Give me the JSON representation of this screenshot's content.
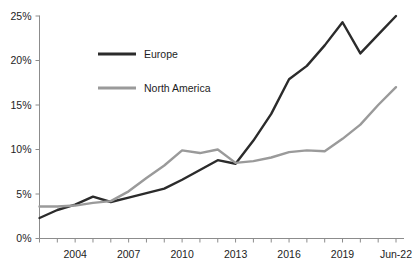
{
  "chart_data": {
    "type": "line",
    "title": "",
    "subtitle": "",
    "xlabel": "",
    "ylabel": "",
    "ylim": [
      0,
      25
    ],
    "ytick_labels": [
      "0%",
      "5%",
      "10%",
      "15%",
      "20%",
      "25%"
    ],
    "ytick_values": [
      0,
      5,
      10,
      15,
      20,
      25
    ],
    "grid": false,
    "legend_position": "inside-upper-left",
    "x": [
      2002,
      2003,
      2004,
      2005,
      2006,
      2007,
      2008,
      2009,
      2010,
      2011,
      2012,
      2013,
      2014,
      2015,
      2016,
      2017,
      2018,
      2019,
      2020,
      2021,
      2022
    ],
    "xtick_labels_shown": [
      "2004",
      "2007",
      "2010",
      "2013",
      "2016",
      "2019",
      "Jun-22"
    ],
    "xtick_label_positions": [
      2004,
      2007,
      2010,
      2013,
      2016,
      2019,
      2022
    ],
    "series": [
      {
        "name": "Europe",
        "color": "#2b2b2b",
        "values": [
          2.3,
          3.2,
          3.8,
          4.7,
          4.1,
          4.6,
          5.1,
          5.6,
          6.6,
          7.7,
          8.8,
          8.4,
          11.0,
          14.0,
          17.9,
          19.4,
          21.7,
          24.3,
          20.8,
          22.9,
          25.0
        ]
      },
      {
        "name": "North America",
        "color": "#9a9a9a",
        "values": [
          3.6,
          3.6,
          3.7,
          4.0,
          4.2,
          5.3,
          6.8,
          8.2,
          9.9,
          9.6,
          10.0,
          8.5,
          8.7,
          9.1,
          9.7,
          9.9,
          9.8,
          11.2,
          12.8,
          15.0,
          17.0
        ]
      }
    ]
  },
  "legend": {
    "items": [
      {
        "label": "Europe",
        "color": "#2b2b2b"
      },
      {
        "label": "North America",
        "color": "#9a9a9a"
      }
    ]
  },
  "axis": {
    "y_labels": [
      "25%",
      "20%",
      "15%",
      "10%",
      "5%",
      "0%"
    ],
    "x_labels": [
      "2004",
      "2007",
      "2010",
      "2013",
      "2016",
      "2019",
      "Jun-22"
    ]
  }
}
